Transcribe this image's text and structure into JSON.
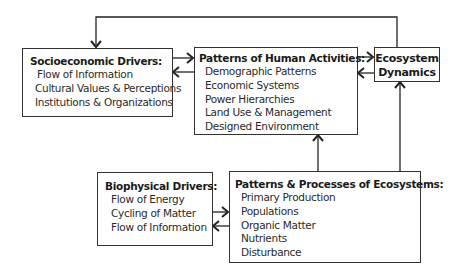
{
  "diagram": {
    "socioeconomic": {
      "title": "Socioeconomic Drivers:",
      "items": [
        "Flow of Information",
        "Cultural Values & Perceptions",
        "Institutions & Organizations"
      ]
    },
    "human_activities": {
      "title": "Patterns of Human Activities:",
      "items": [
        "Demographic Patterns",
        "Economic Systems",
        "Power Hierarchies",
        "Land Use & Management",
        "Designed Environment"
      ]
    },
    "ecosystem_dynamics": {
      "title_line1": "Ecosystem",
      "title_line2": "Dynamics"
    },
    "biophysical": {
      "title": "Biophysical Drivers:",
      "items": [
        "Flow of Energy",
        "Cycling of Matter",
        "Flow of Information"
      ]
    },
    "ecosystems": {
      "title": "Patterns & Processes of Ecosystems:",
      "items": [
        "Primary Production",
        "Populations",
        "Organic Matter",
        "Nutrients",
        "Disturbance"
      ]
    },
    "connections": [
      {
        "from": "socioeconomic",
        "to": "human_activities"
      },
      {
        "from": "human_activities",
        "to": "socioeconomic"
      },
      {
        "from": "human_activities",
        "to": "ecosystem_dynamics"
      },
      {
        "from": "ecosystem_dynamics",
        "to": "human_activities"
      },
      {
        "from": "ecosystem_dynamics",
        "to": "socioeconomic"
      },
      {
        "from": "ecosystems",
        "to": "ecosystem_dynamics"
      },
      {
        "from": "ecosystems",
        "to": "human_activities"
      },
      {
        "from": "biophysical",
        "to": "ecosystems"
      },
      {
        "from": "ecosystems",
        "to": "biophysical"
      }
    ]
  }
}
